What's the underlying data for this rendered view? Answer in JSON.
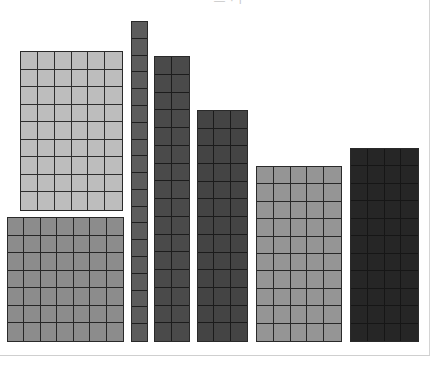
{
  "diagram": {
    "title_fragment": "— · ı’",
    "blocks": [
      {
        "id": "block-1",
        "label": "6 x 9 light gray array",
        "cols": 6,
        "rows": 9,
        "x": 20,
        "y": 51,
        "w": 103,
        "h": 160,
        "color": "#bdbdbd"
      },
      {
        "id": "block-2",
        "label": "7 x 7 medium gray array",
        "cols": 7,
        "rows": 7,
        "x": 7,
        "y": 217,
        "w": 117,
        "h": 125,
        "color": "#8c8c8c"
      },
      {
        "id": "block-3",
        "label": "1 x 19 dark gray column",
        "cols": 1,
        "rows": 19,
        "x": 131,
        "y": 21,
        "w": 17,
        "h": 321,
        "color": "#5c5c5c"
      },
      {
        "id": "block-4",
        "label": "2 x 16 dark gray column",
        "cols": 2,
        "rows": 16,
        "x": 154,
        "y": 56,
        "w": 36,
        "h": 286,
        "color": "#4a4a4a"
      },
      {
        "id": "block-5",
        "label": "3 x 13 dark gray array",
        "cols": 3,
        "rows": 13,
        "x": 197,
        "y": 110,
        "w": 51,
        "h": 232,
        "color": "#444444"
      },
      {
        "id": "block-6",
        "label": "5 x 10 medium gray array",
        "cols": 5,
        "rows": 10,
        "x": 256,
        "y": 166,
        "w": 86,
        "h": 176,
        "color": "#959595"
      },
      {
        "id": "block-7",
        "label": "4 x 11 near-black array",
        "cols": 4,
        "rows": 11,
        "x": 350,
        "y": 148,
        "w": 69,
        "h": 194,
        "color": "#262626"
      }
    ]
  },
  "frame": {
    "border_color": "#d4d4d4"
  }
}
